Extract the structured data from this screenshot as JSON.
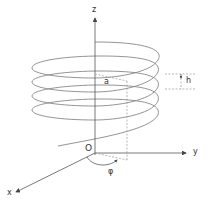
{
  "figure": {
    "axes": {
      "x": "x",
      "y": "y",
      "z": "z",
      "origin": "O"
    },
    "labels": {
      "radius": "a",
      "pitch": "h",
      "angle": "φ"
    },
    "colors": {
      "helix": "#777777",
      "axis": "#555555",
      "dashed": "#999999"
    }
  }
}
